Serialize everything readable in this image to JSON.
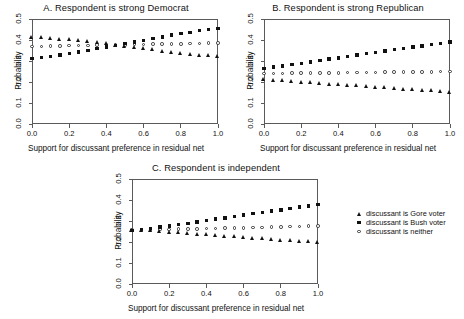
{
  "figure": {
    "xlabel": "Support for discussant preference in residual net",
    "ylabel": "Probability",
    "xticks": [
      "0.0",
      "0.2",
      "0.4",
      "0.6",
      "0.8",
      "1.0"
    ],
    "yticks": [
      "0.0",
      "0.1",
      "0.2",
      "0.3",
      "0.4",
      "0.5"
    ]
  },
  "legend": {
    "items": [
      {
        "marker": "triangle",
        "label": "discussant is Gore voter"
      },
      {
        "marker": "square",
        "label": "discussant is Bush voter"
      },
      {
        "marker": "circle",
        "label": "discussant is neither"
      }
    ]
  },
  "panels": [
    {
      "id": "A",
      "title": "A. Respondent is strong Democrat"
    },
    {
      "id": "B",
      "title": "B. Respondent is strong Republican"
    },
    {
      "id": "C",
      "title": "C. Respondent is independent"
    }
  ],
  "chart_data": [
    {
      "type": "scatter",
      "title": "A. Respondent is strong Democrat",
      "xlabel": "Support for discussant preference in residual net",
      "ylabel": "Probability",
      "xlim": [
        0.0,
        1.0
      ],
      "ylim": [
        0.0,
        0.5
      ],
      "xticks": [
        0.0,
        0.2,
        0.4,
        0.6,
        0.8,
        1.0
      ],
      "yticks": [
        0.0,
        0.1,
        0.2,
        0.3,
        0.4,
        0.5
      ],
      "grid": false,
      "legend_position": "outside-right",
      "x": [
        0.0,
        0.05,
        0.1,
        0.15,
        0.2,
        0.25,
        0.3,
        0.35,
        0.4,
        0.45,
        0.5,
        0.55,
        0.6,
        0.65,
        0.7,
        0.75,
        0.8,
        0.85,
        0.9,
        0.95,
        1.0
      ],
      "series": [
        {
          "name": "discussant is Gore voter",
          "marker": "triangle",
          "values": [
            0.412,
            0.41,
            0.407,
            0.404,
            0.4,
            0.396,
            0.391,
            0.386,
            0.381,
            0.375,
            0.369,
            0.364,
            0.358,
            0.352,
            0.347,
            0.342,
            0.337,
            0.332,
            0.328,
            0.324,
            0.321
          ]
        },
        {
          "name": "discussant is Bush voter",
          "marker": "square",
          "values": [
            0.311,
            0.316,
            0.322,
            0.329,
            0.336,
            0.343,
            0.351,
            0.359,
            0.367,
            0.375,
            0.383,
            0.391,
            0.399,
            0.407,
            0.415,
            0.423,
            0.43,
            0.437,
            0.444,
            0.45,
            0.456
          ]
        },
        {
          "name": "discussant is neither",
          "marker": "circle",
          "values": [
            0.369,
            0.37,
            0.371,
            0.372,
            0.373,
            0.373,
            0.374,
            0.375,
            0.376,
            0.377,
            0.377,
            0.378,
            0.379,
            0.38,
            0.381,
            0.381,
            0.382,
            0.383,
            0.384,
            0.385,
            0.386
          ]
        }
      ]
    },
    {
      "type": "scatter",
      "title": "B. Respondent is strong Republican",
      "xlabel": "Support for discussant preference in residual net",
      "ylabel": "Probability",
      "xlim": [
        0.0,
        1.0
      ],
      "ylim": [
        0.0,
        0.5
      ],
      "xticks": [
        0.0,
        0.2,
        0.4,
        0.6,
        0.8,
        1.0
      ],
      "yticks": [
        0.0,
        0.1,
        0.2,
        0.3,
        0.4,
        0.5
      ],
      "grid": false,
      "legend_position": "outside-right",
      "x": [
        0.0,
        0.05,
        0.1,
        0.15,
        0.2,
        0.25,
        0.3,
        0.35,
        0.4,
        0.45,
        0.5,
        0.55,
        0.6,
        0.65,
        0.7,
        0.75,
        0.8,
        0.85,
        0.9,
        0.95,
        1.0
      ],
      "series": [
        {
          "name": "discussant is Gore voter",
          "marker": "triangle",
          "values": [
            0.21,
            0.207,
            0.205,
            0.202,
            0.199,
            0.196,
            0.193,
            0.19,
            0.187,
            0.184,
            0.181,
            0.178,
            0.175,
            0.172,
            0.169,
            0.166,
            0.163,
            0.16,
            0.157,
            0.154,
            0.151
          ]
        },
        {
          "name": "discussant is Bush voter",
          "marker": "square",
          "values": [
            0.265,
            0.271,
            0.277,
            0.283,
            0.289,
            0.296,
            0.302,
            0.309,
            0.315,
            0.322,
            0.328,
            0.335,
            0.341,
            0.348,
            0.354,
            0.36,
            0.366,
            0.372,
            0.378,
            0.384,
            0.39
          ]
        },
        {
          "name": "discussant is neither",
          "marker": "circle",
          "values": [
            0.24,
            0.241,
            0.241,
            0.242,
            0.242,
            0.243,
            0.243,
            0.244,
            0.244,
            0.245,
            0.245,
            0.246,
            0.246,
            0.247,
            0.247,
            0.248,
            0.248,
            0.249,
            0.249,
            0.25,
            0.25
          ]
        }
      ]
    },
    {
      "type": "scatter",
      "title": "C. Respondent is independent",
      "xlabel": "Support for discussant preference in residual net",
      "ylabel": "Probability",
      "xlim": [
        0.0,
        1.0
      ],
      "ylim": [
        0.0,
        0.5
      ],
      "xticks": [
        0.0,
        0.2,
        0.4,
        0.6,
        0.8,
        1.0
      ],
      "yticks": [
        0.0,
        0.1,
        0.2,
        0.3,
        0.4,
        0.5
      ],
      "grid": false,
      "legend_position": "outside-right",
      "x": [
        0.0,
        0.05,
        0.1,
        0.15,
        0.2,
        0.25,
        0.3,
        0.35,
        0.4,
        0.45,
        0.5,
        0.55,
        0.6,
        0.65,
        0.7,
        0.75,
        0.8,
        0.85,
        0.9,
        0.95,
        1.0
      ],
      "series": [
        {
          "name": "discussant is Gore voter",
          "marker": "triangle",
          "values": [
            0.256,
            0.254,
            0.252,
            0.25,
            0.247,
            0.244,
            0.24,
            0.237,
            0.233,
            0.23,
            0.227,
            0.224,
            0.221,
            0.218,
            0.215,
            0.212,
            0.209,
            0.206,
            0.203,
            0.2,
            0.197
          ]
        },
        {
          "name": "discussant is Bush voter",
          "marker": "square",
          "values": [
            0.255,
            0.26,
            0.265,
            0.271,
            0.277,
            0.283,
            0.289,
            0.296,
            0.302,
            0.309,
            0.315,
            0.322,
            0.328,
            0.335,
            0.341,
            0.347,
            0.353,
            0.36,
            0.366,
            0.372,
            0.378
          ]
        },
        {
          "name": "discussant is neither",
          "marker": "circle",
          "values": [
            0.256,
            0.257,
            0.258,
            0.259,
            0.26,
            0.261,
            0.262,
            0.263,
            0.264,
            0.265,
            0.266,
            0.267,
            0.268,
            0.269,
            0.27,
            0.271,
            0.272,
            0.273,
            0.274,
            0.275,
            0.276
          ]
        }
      ]
    }
  ]
}
